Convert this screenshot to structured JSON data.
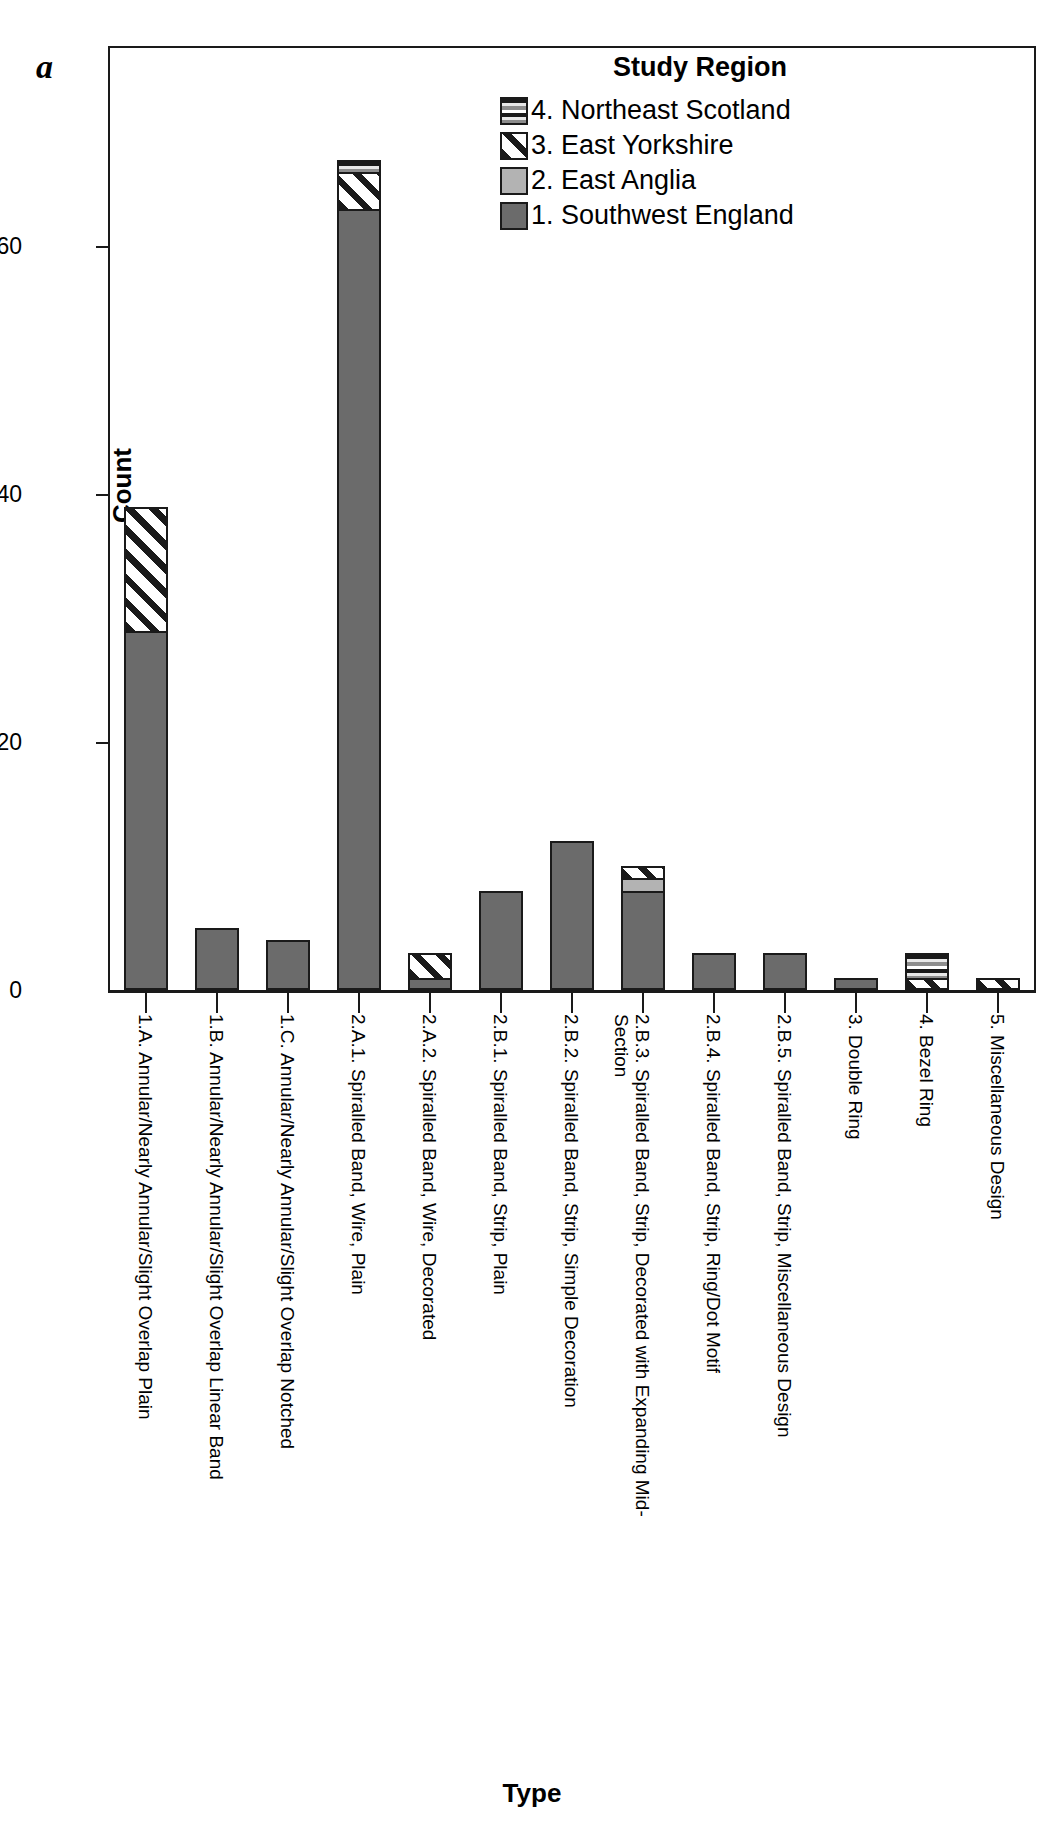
{
  "panel": {
    "letter": "a"
  },
  "legend": {
    "title": "Study Region",
    "position": "top-right-inside",
    "items": [
      {
        "key": "r4",
        "label": "4. Northeast Scotland",
        "pattern": "horizontal-lines",
        "color": "#8d8d8d"
      },
      {
        "key": "r3",
        "label": "3. East Yorkshire",
        "pattern": "diagonal-hatch",
        "color": "#1a1a1a"
      },
      {
        "key": "r2",
        "label": "2. East Anglia",
        "pattern": "solid",
        "color": "#b3b3b3"
      },
      {
        "key": "r1",
        "label": "1. Southwest England",
        "pattern": "solid",
        "color": "#6b6b6b"
      }
    ]
  },
  "axes": {
    "y_title": "Count",
    "x_title": "Type",
    "y_ticks": [
      "0",
      "20",
      "40",
      "60"
    ]
  },
  "chart_data": {
    "type": "bar",
    "subtype": "stacked",
    "title": "",
    "xlabel": "Type",
    "ylabel": "Count",
    "ylim": [
      0,
      76
    ],
    "ytick_values": [
      0,
      20,
      40,
      60
    ],
    "grid": false,
    "legend_position": "top-right-inside",
    "legend_title": "Study Region",
    "categories": [
      "1.A. Annular/Nearly Annular/Slight Overlap Plain",
      "1.B. Annular/Nearly Annular/Slight Overlap Linear Band",
      "1.C. Annular/Nearly Annular/Slight Overlap Notched",
      "2.A.1. Spiralled Band, Wire, Plain",
      "2.A.2. Spiralled Band, Wire, Decorated",
      "2.B.1. Spiralled Band, Strip, Plain",
      "2.B.2. Spiralled Band, Strip, Simple Decoration",
      "2.B.3. Spiralled Band, Strip, Decorated with Expanding Mid-Section",
      "2.B.4. Spiralled Band, Strip, Ring/Dot Motif",
      "2.B.5. Spiralled Band, Strip, Miscellaneous Design",
      "3. Double Ring",
      "4. Bezel Ring",
      "5. Miscellaneous Design"
    ],
    "series": [
      {
        "name": "1. Southwest England",
        "values": [
          29,
          5,
          4,
          63,
          1,
          8,
          12,
          8,
          3,
          3,
          1,
          0,
          0
        ]
      },
      {
        "name": "2. East Anglia",
        "values": [
          0,
          0,
          0,
          0,
          0,
          0,
          0,
          1,
          0,
          0,
          0,
          0,
          0
        ]
      },
      {
        "name": "3. East Yorkshire",
        "values": [
          10,
          0,
          0,
          3,
          2,
          0,
          0,
          1,
          0,
          0,
          0,
          1,
          1
        ]
      },
      {
        "name": "4. Northeast Scotland",
        "values": [
          0,
          0,
          0,
          1,
          0,
          0,
          0,
          0,
          0,
          0,
          0,
          2,
          0
        ]
      }
    ],
    "totals": [
      39,
      5,
      4,
      67,
      3,
      8,
      12,
      10,
      3,
      3,
      1,
      3,
      1
    ]
  }
}
